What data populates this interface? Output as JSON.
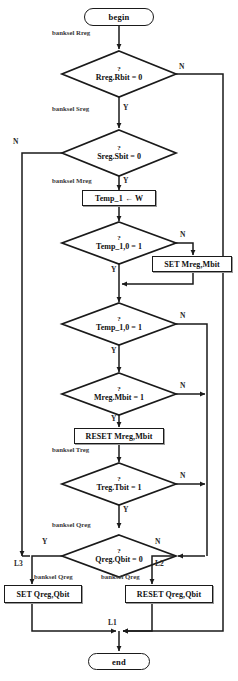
{
  "diagram": {
    "nodes": {
      "begin": "begin",
      "end": "end",
      "d_rreg": "Rreg.Rbit = 0",
      "d_sreg": "Sreg.Sbit = 0",
      "p_temp": "Temp_1 ← W",
      "d_temp_a": "Temp_1,0 = 1",
      "p_set_mreg": "SET Mreg,Mbit",
      "d_temp_b": "Temp_1,0 = 1",
      "d_mreg": "Mreg.Mbit = 1",
      "p_reset_mreg": "RESET Mreg,Mbit",
      "d_treg": "Treg.Tbit = 1",
      "d_qreg": "Qreg.Qbit  = 0",
      "p_set_qreg": "SET Qreg,Qbit",
      "p_reset_qreg": "RESET Qreg,Qbit",
      "question_mark": "?"
    },
    "edge_labels": {
      "banksel_rreg": "banksel Rreg",
      "banksel_sreg": "banksel Sreg",
      "banksel_mreg": "banksel Mreg",
      "banksel_treg": "banksel Treg",
      "banksel_qreg": "banksel Qreg",
      "banksel_qreg2": "banksel Qreg",
      "banksel_qreg3": "banksel Qreg",
      "yes": "Y",
      "no": "N",
      "l1": "L1",
      "l2": "L2",
      "l3": "L3"
    },
    "colors": {
      "line": "#1a1a1a",
      "text": "#101010",
      "background": "#ffffff",
      "shadow": "#9a9a9a"
    }
  }
}
